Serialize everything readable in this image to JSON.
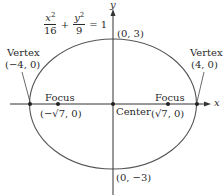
{
  "equation": {
    "term1": {
      "var": "x",
      "exp": "2",
      "den": "16"
    },
    "plus": "+",
    "term2": {
      "var": "y",
      "exp": "2",
      "den": "9"
    },
    "rhs": "= 1"
  },
  "axes": {
    "x_label": "x",
    "y_label": "y"
  },
  "points": {
    "top": "(0, 3)",
    "bottom": "(0, −3)",
    "center": "Center",
    "vertex_left": {
      "title": "Vertex",
      "coord": "(−4, 0)"
    },
    "vertex_right": {
      "title": "Vertex",
      "coord": "(4, 0)"
    },
    "focus_left": {
      "title": "Focus",
      "coord": "(−√7, 0)"
    },
    "focus_right": {
      "title": "Focus",
      "coord": "(√7, 0)"
    }
  },
  "colors": {
    "ellipse": "#555555",
    "axes": "#333333",
    "text": "#2a2a2a"
  }
}
